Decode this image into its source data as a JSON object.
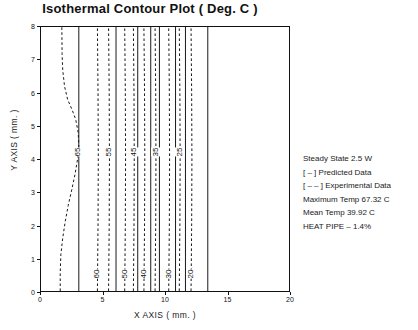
{
  "chart_data": {
    "type": "line",
    "title": "Isothermal Contour Plot  ( Deg. C )",
    "xlabel": "X AXIS ( mm. )",
    "ylabel": "Y AXIS ( mm. )",
    "xlim": [
      0,
      20
    ],
    "ylim": [
      0,
      8
    ],
    "xticks": [
      0,
      5,
      10,
      15,
      20
    ],
    "yticks": [
      0,
      1,
      2,
      3,
      4,
      5,
      6,
      7,
      8
    ],
    "grid": false,
    "legend_position": "right-outside",
    "units": "Deg. C",
    "series": [
      {
        "name": "65",
        "style": "dashed",
        "kind": "experimental",
        "label": "65",
        "label_y": 4.2,
        "points": [
          [
            1.55,
            0.0
          ],
          [
            1.55,
            0.55
          ],
          [
            1.6,
            1.1
          ],
          [
            1.75,
            1.6
          ],
          [
            1.95,
            2.1
          ],
          [
            2.2,
            2.6
          ],
          [
            2.5,
            3.1
          ],
          [
            2.75,
            3.55
          ],
          [
            2.95,
            4.0
          ],
          [
            3.05,
            4.4
          ],
          [
            3.0,
            4.8
          ],
          [
            2.8,
            5.2
          ],
          [
            2.5,
            5.5
          ],
          [
            2.15,
            5.8
          ],
          [
            1.9,
            6.2
          ],
          [
            1.75,
            6.7
          ],
          [
            1.7,
            7.2
          ],
          [
            1.68,
            8.0
          ]
        ]
      },
      {
        "name": "60",
        "style": "dashed",
        "kind": "experimental",
        "label": "60",
        "label_y": 0.55,
        "points": [
          [
            4.55,
            0.0
          ],
          [
            4.6,
            2.0
          ],
          [
            4.62,
            4.0
          ],
          [
            4.6,
            6.0
          ],
          [
            4.55,
            8.0
          ]
        ]
      },
      {
        "name": "60p",
        "style": "solid",
        "kind": "predicted",
        "label": "",
        "label_y": null,
        "points": [
          [
            3.05,
            0.0
          ],
          [
            3.05,
            8.0
          ]
        ]
      },
      {
        "name": "55",
        "style": "dashed",
        "kind": "experimental",
        "label": "55",
        "label_y": 4.2,
        "points": [
          [
            5.45,
            0.0
          ],
          [
            5.5,
            2.0
          ],
          [
            5.52,
            4.0
          ],
          [
            5.5,
            6.0
          ],
          [
            5.45,
            8.0
          ]
        ]
      },
      {
        "name": "55p",
        "style": "solid",
        "kind": "predicted",
        "label": "",
        "label_y": null,
        "points": [
          [
            6.05,
            0.0
          ],
          [
            6.05,
            8.0
          ]
        ]
      },
      {
        "name": "50",
        "style": "dashed",
        "kind": "experimental",
        "label": "50",
        "label_y": 0.55,
        "points": [
          [
            6.75,
            0.0
          ],
          [
            6.8,
            2.0
          ],
          [
            6.82,
            4.0
          ],
          [
            6.8,
            6.0
          ],
          [
            6.75,
            8.0
          ]
        ]
      },
      {
        "name": "50p",
        "style": "solid",
        "kind": "predicted",
        "label": "",
        "label_y": null,
        "points": [
          [
            7.8,
            0.0
          ],
          [
            7.8,
            8.0
          ]
        ]
      },
      {
        "name": "45",
        "style": "dashed",
        "kind": "experimental",
        "label": "45",
        "label_y": 4.2,
        "points": [
          [
            7.45,
            0.0
          ],
          [
            7.5,
            2.0
          ],
          [
            7.52,
            4.0
          ],
          [
            7.5,
            6.0
          ],
          [
            7.45,
            8.0
          ]
        ]
      },
      {
        "name": "45p",
        "style": "solid",
        "kind": "predicted",
        "label": "",
        "label_y": null,
        "points": [
          [
            8.85,
            0.0
          ],
          [
            8.85,
            8.0
          ]
        ]
      },
      {
        "name": "40",
        "style": "dashed",
        "kind": "experimental",
        "label": "40",
        "label_y": 0.55,
        "points": [
          [
            8.3,
            0.0
          ],
          [
            8.35,
            2.0
          ],
          [
            8.37,
            4.0
          ],
          [
            8.35,
            6.0
          ],
          [
            8.3,
            8.0
          ]
        ]
      },
      {
        "name": "40p",
        "style": "solid",
        "kind": "predicted",
        "label": "",
        "label_y": null,
        "points": [
          [
            9.55,
            0.0
          ],
          [
            9.55,
            8.0
          ]
        ]
      },
      {
        "name": "35",
        "style": "dashed",
        "kind": "experimental",
        "label": "35",
        "label_y": 4.2,
        "points": [
          [
            9.2,
            0.0
          ],
          [
            9.25,
            2.0
          ],
          [
            9.27,
            4.0
          ],
          [
            9.25,
            6.0
          ],
          [
            9.2,
            8.0
          ]
        ]
      },
      {
        "name": "35p",
        "style": "solid",
        "kind": "predicted",
        "label": "",
        "label_y": null,
        "points": [
          [
            10.85,
            0.0
          ],
          [
            10.85,
            8.0
          ]
        ]
      },
      {
        "name": "30",
        "style": "dashed",
        "kind": "experimental",
        "label": "30",
        "label_y": 0.55,
        "points": [
          [
            10.3,
            0.0
          ],
          [
            10.35,
            2.0
          ],
          [
            10.37,
            4.0
          ],
          [
            10.35,
            6.0
          ],
          [
            10.3,
            8.0
          ]
        ]
      },
      {
        "name": "30p",
        "style": "solid",
        "kind": "predicted",
        "label": "",
        "label_y": null,
        "points": [
          [
            11.65,
            0.0
          ],
          [
            11.65,
            8.0
          ]
        ]
      },
      {
        "name": "25",
        "style": "dashed",
        "kind": "experimental",
        "label": "25",
        "label_y": 4.2,
        "points": [
          [
            11.15,
            0.0
          ],
          [
            11.2,
            2.0
          ],
          [
            11.22,
            4.0
          ],
          [
            11.2,
            6.0
          ],
          [
            11.15,
            8.0
          ]
        ]
      },
      {
        "name": "20",
        "style": "dashed",
        "kind": "experimental",
        "label": "20",
        "label_y": 0.55,
        "points": [
          [
            12.1,
            0.0
          ],
          [
            12.15,
            2.0
          ],
          [
            12.17,
            4.0
          ],
          [
            12.15,
            6.0
          ],
          [
            12.1,
            8.0
          ]
        ]
      },
      {
        "name": "20p",
        "style": "solid",
        "kind": "predicted",
        "label": "",
        "label_y": null,
        "points": [
          [
            13.45,
            0.0
          ],
          [
            13.45,
            8.0
          ]
        ]
      }
    ],
    "annotations": [
      "Steady State 2.5 W",
      "[ – ] Predicted Data",
      "[ – – ] Experimental Data",
      "Maximum Temp 67.32 C",
      "Mean Temp 39.92 C",
      "HEAT PIPE – 1.4%"
    ],
    "colors": {
      "line": "#1a1a1a",
      "axis": "#111111",
      "background": "#ffffff"
    }
  }
}
